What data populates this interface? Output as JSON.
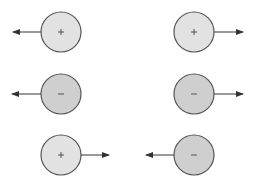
{
  "diagram": {
    "colors": {
      "positive_fill": "#e2e2e2",
      "negative_fill": "#cfcfcf",
      "stroke": "#555555",
      "arrow": "#333333"
    },
    "particles": [
      {
        "id": "p1",
        "charge": "+",
        "cx": 61,
        "cy": 32,
        "r": 20,
        "arrow_dir": "left",
        "arrow_end_x": 13
      },
      {
        "id": "p2",
        "charge": "+",
        "cx": 194,
        "cy": 32,
        "r": 20,
        "arrow_dir": "right",
        "arrow_end_x": 243
      },
      {
        "id": "p3",
        "charge": "−",
        "cx": 61,
        "cy": 94,
        "r": 20,
        "arrow_dir": "left",
        "arrow_end_x": 12
      },
      {
        "id": "p4",
        "charge": "−",
        "cx": 194,
        "cy": 94,
        "r": 20,
        "arrow_dir": "right",
        "arrow_end_x": 243
      },
      {
        "id": "p5",
        "charge": "+",
        "cx": 61,
        "cy": 155,
        "r": 20,
        "arrow_dir": "right",
        "arrow_end_x": 109
      },
      {
        "id": "p6",
        "charge": "−",
        "cx": 194,
        "cy": 155,
        "r": 20,
        "arrow_dir": "left",
        "arrow_end_x": 146
      }
    ]
  }
}
